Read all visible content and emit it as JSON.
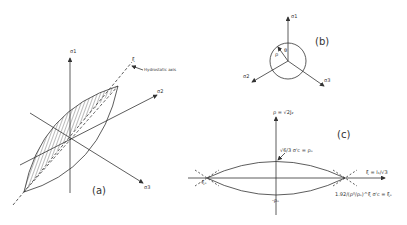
{
  "figure": {
    "panels": [
      {
        "id": "a",
        "label": "(a)",
        "axes": {
          "s1": "σ1",
          "s2": "σ2",
          "s3": "σ3",
          "xi": "ξ"
        },
        "annotation": "Hydrostatic axis"
      },
      {
        "id": "b",
        "label": "(b)",
        "axes": {
          "s1": "σ1",
          "s2": "σ2",
          "s3": "σ3"
        },
        "symbols": {
          "rho": "ρ",
          "theta": "θ"
        }
      },
      {
        "id": "c",
        "label": "(c)",
        "vertical_axis": "ρ = √2J₂",
        "horizontal_axis": "ξ = I₁/√3",
        "top_value": "√6/3 σ'c = ρₒ",
        "bottom_value": "-ρₒ",
        "left_value": "-ξₒ",
        "right_value": "1.92/(ρ⁰/ρₒ)^ξ σ'c = ξₒ"
      }
    ]
  }
}
